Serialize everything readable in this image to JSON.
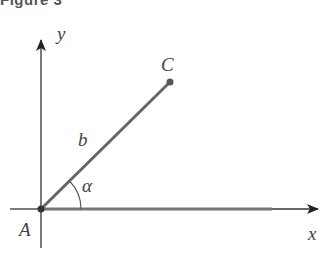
{
  "figure": {
    "title": "Figure 3",
    "labels": {
      "origin": "A",
      "point": "C",
      "segment": "b",
      "angle": "α",
      "x_axis": "x",
      "y_axis": "y"
    },
    "geometry": {
      "origin": [
        41,
        209
      ],
      "point_c": [
        170,
        82
      ],
      "x_axis_end": [
        320,
        209
      ],
      "x_axis_start": [
        10,
        209
      ],
      "y_axis_end": [
        41,
        38
      ],
      "y_axis_start": [
        41,
        248
      ]
    },
    "colors": {
      "axis": "#333333",
      "segment": "#666666",
      "label": "#444444"
    }
  }
}
